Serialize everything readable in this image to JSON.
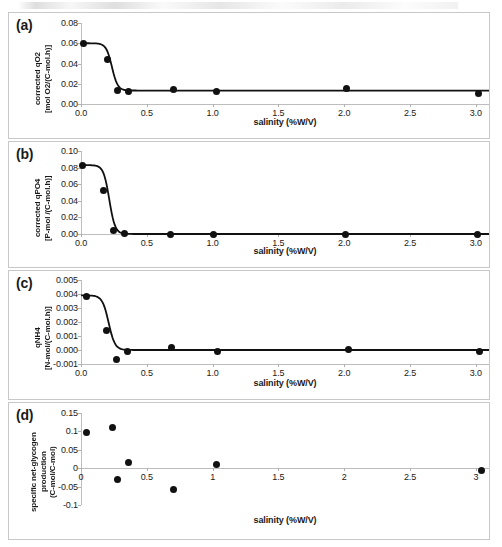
{
  "figure": {
    "xlabel": "salinity (%W/V)",
    "panels": [
      {
        "tag": "(a)",
        "ylabel": "corrected qO2\n[mol O2/(C-mol.h)]",
        "yticks": [
          "0.00",
          "0.02",
          "0.04",
          "0.06",
          "0.08"
        ],
        "xticks": [
          "0.0",
          "0.5",
          "1.0",
          "1.5",
          "2.0",
          "2.5",
          "3.0"
        ]
      },
      {
        "tag": "(b)",
        "ylabel": "corrected qPO4\n[P-mol /(C-mol.h)]",
        "yticks": [
          "0.00",
          "0.02",
          "0.04",
          "0.06",
          "0.08",
          "0.10"
        ],
        "xticks": [
          "0.0",
          "0.5",
          "1.0",
          "1.5",
          "2.0",
          "2.5",
          "3.0"
        ]
      },
      {
        "tag": "(c)",
        "ylabel": "qNH4\n[N-mol/(C-mol.h)]",
        "yticks": [
          "-0.001",
          "0.000",
          "0.001",
          "0.002",
          "0.003",
          "0.004",
          "0.005"
        ],
        "xticks": [
          "0.0",
          "0.5",
          "1.0",
          "1.5",
          "2.0",
          "2.5",
          "3.0"
        ]
      },
      {
        "tag": "(d)",
        "ylabel": "specific net-glycogen\nproduction\n(C-mol/C-mol)",
        "yticks": [
          "-0.1",
          "-0.05",
          "0",
          "0.05",
          "0.1",
          "0.15"
        ],
        "xticks": [
          "0",
          "0.5",
          "1",
          "1.5",
          "2",
          "2.5",
          "3"
        ]
      }
    ]
  },
  "chart_data": [
    {
      "type": "scatter",
      "panel": "(a)",
      "title": "",
      "xlabel": "salinity (%W/V)",
      "ylabel": "corrected qO2 [mol O2/(C-mol.h)]",
      "xlim": [
        0.0,
        3.1
      ],
      "ylim": [
        0.0,
        0.08
      ],
      "xticks": [
        0.0,
        0.5,
        1.0,
        1.5,
        2.0,
        2.5,
        3.0
      ],
      "yticks": [
        0.0,
        0.02,
        0.04,
        0.06,
        0.08
      ],
      "grid": false,
      "legend": null,
      "has_fit_curve": true,
      "fit_curve_description": "sigmoidal decay from 0.060 plateau to 0.013 plateau, midpoint near salinity 0.24",
      "x": [
        0.02,
        0.2,
        0.28,
        0.36,
        0.7,
        1.03,
        2.02,
        3.02
      ],
      "y": [
        0.0598,
        0.0443,
        0.0138,
        0.0123,
        0.0145,
        0.0122,
        0.0152,
        0.0108
      ]
    },
    {
      "type": "scatter",
      "panel": "(b)",
      "title": "",
      "xlabel": "salinity (%W/V)",
      "ylabel": "corrected qPO4 [P-mol /(C-mol.h)]",
      "xlim": [
        0.0,
        3.1
      ],
      "ylim": [
        0.0,
        0.1
      ],
      "xticks": [
        0.0,
        0.5,
        1.0,
        1.5,
        2.0,
        2.5,
        3.0
      ],
      "yticks": [
        0.0,
        0.02,
        0.04,
        0.06,
        0.08,
        0.1
      ],
      "grid": false,
      "legend": null,
      "has_fit_curve": true,
      "fit_curve_description": "sigmoidal decay from 0.083 plateau to 0.000 plateau, midpoint near salinity 0.21",
      "x": [
        0.01,
        0.17,
        0.25,
        0.33,
        0.68,
        1.01,
        2.01,
        3.01
      ],
      "y": [
        0.0822,
        0.053,
        0.0048,
        0.001,
        0.0,
        0.0,
        0.0,
        0.0
      ]
    },
    {
      "type": "scatter",
      "panel": "(c)",
      "title": "",
      "xlabel": "salinity (%W/V)",
      "ylabel": "qNH4 [N-mol/(C-mol.h)]",
      "xlim": [
        0.0,
        3.1
      ],
      "ylim": [
        -0.001,
        0.005
      ],
      "xticks": [
        0.0,
        0.5,
        1.0,
        1.5,
        2.0,
        2.5,
        3.0
      ],
      "yticks": [
        -0.001,
        0.0,
        0.001,
        0.002,
        0.003,
        0.004,
        0.005
      ],
      "grid": false,
      "legend": null,
      "has_fit_curve": true,
      "fit_curve_description": "sigmoidal decay from 0.0039 plateau to 0.0000 plateau, midpoint near salinity 0.21",
      "x": [
        0.04,
        0.19,
        0.27,
        0.35,
        0.69,
        1.04,
        2.03,
        3.03
      ],
      "y": [
        0.0038,
        0.0014,
        -0.0007,
        -0.0001,
        0.0002,
        -0.0001,
        5e-05,
        -0.0001
      ]
    },
    {
      "type": "scatter",
      "panel": "(d)",
      "title": "",
      "xlabel": "salinity (%W/V)",
      "ylabel": "specific net-glycogen production (C-mol/C-mol)",
      "xlim": [
        0.0,
        3.1
      ],
      "ylim": [
        -0.1,
        0.15
      ],
      "xticks": [
        0,
        0.5,
        1,
        1.5,
        2,
        2.5,
        3
      ],
      "yticks": [
        -0.1,
        -0.05,
        0,
        0.05,
        0.1,
        0.15
      ],
      "grid": false,
      "legend": null,
      "has_fit_curve": false,
      "x": [
        0.04,
        0.24,
        0.28,
        0.36,
        0.7,
        1.03,
        3.04
      ],
      "y": [
        0.097,
        0.111,
        -0.032,
        0.016,
        -0.057,
        0.009,
        -0.006
      ]
    }
  ]
}
